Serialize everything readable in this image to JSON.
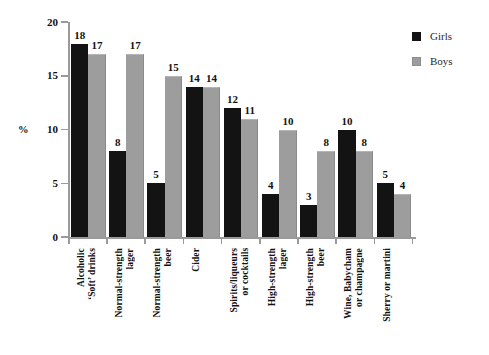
{
  "chart_data": {
    "type": "bar",
    "title": "",
    "xlabel": "",
    "ylabel": "%",
    "ylim": [
      0,
      20
    ],
    "yticks": [
      0,
      5,
      10,
      15,
      20
    ],
    "grid": false,
    "legend_position": "right",
    "categories": [
      "Alcoholic\n‘Soft’ drinks",
      "Normal-strength\nlager",
      "Normal-strength\nbeer",
      "Cider",
      "Spirits/liqueurs\nor cocktails",
      "High-strength\nlager",
      "High-strength\nbeer",
      "Wine, Babycham\nor champagne",
      "Sherry or martini"
    ],
    "series": [
      {
        "name": "Girls",
        "color": "#131313",
        "values": [
          18,
          8,
          5,
          14,
          12,
          4,
          3,
          10,
          5
        ]
      },
      {
        "name": "Boys",
        "color": "#9d9d9d",
        "values": [
          17,
          17,
          15,
          14,
          11,
          10,
          8,
          8,
          4
        ]
      }
    ]
  },
  "legend": {
    "items": [
      {
        "label": "Girls",
        "color": "#131313"
      },
      {
        "label": "Boys",
        "color": "#9d9d9d"
      }
    ]
  }
}
